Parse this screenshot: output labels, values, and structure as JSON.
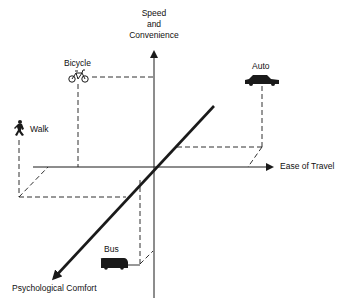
{
  "diagram": {
    "type": "3d-axis-comparison",
    "axes": {
      "vertical": {
        "label_lines": [
          "Speed",
          "and",
          "Convenience"
        ]
      },
      "horizontal": {
        "label": "Ease of Travel"
      },
      "depth": {
        "label": "Psychological Comfort"
      }
    },
    "modes": [
      {
        "id": "bicycle",
        "label": "Bicycle",
        "icon": "bicycle-icon"
      },
      {
        "id": "auto",
        "label": "Auto",
        "icon": "car-icon"
      },
      {
        "id": "walk",
        "label": "Walk",
        "icon": "walking-person-icon"
      },
      {
        "id": "bus",
        "label": "Bus",
        "icon": "bus-icon"
      }
    ],
    "colors": {
      "line": "#1a1a1a",
      "background": "#ffffff"
    }
  }
}
